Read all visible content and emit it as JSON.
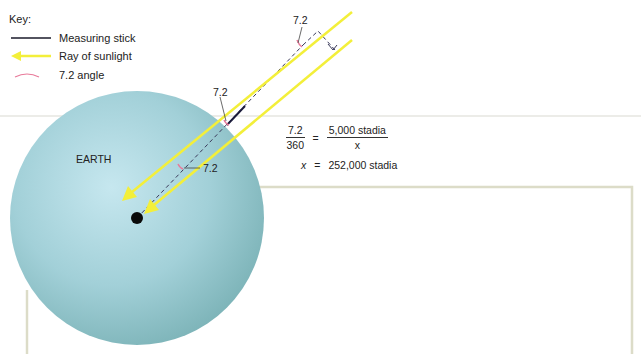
{
  "key": {
    "title": "Key:",
    "items": [
      {
        "label": "Measuring stick",
        "icon": "black-line",
        "color": "#1a1a2a"
      },
      {
        "label": "Ray of sunlight",
        "icon": "yellow-arrow",
        "color": "#f3ef3a"
      },
      {
        "label": "7.2 angle",
        "icon": "pink-arc",
        "color": "#e87a9a"
      }
    ]
  },
  "diagram": {
    "earth_label": "EARTH",
    "angle_label_top": "7.2",
    "angle_label_surface": "7.2",
    "angle_label_center": "7.2",
    "colors": {
      "earth": "#8fc3c8",
      "earth_highlight": "#bfe3ec",
      "ray": "#f3ef3a",
      "stick": "#1a1a3a",
      "angle": "#e87a9a",
      "frame": "#dcdcc8"
    }
  },
  "equation": {
    "lhs_num": "7.2",
    "lhs_den": "360",
    "equals": "=",
    "rhs_num": "5,000 stadia",
    "rhs_den": "x",
    "result_var": "x",
    "result_equals": "=",
    "result_value": "252,000 stadia"
  }
}
